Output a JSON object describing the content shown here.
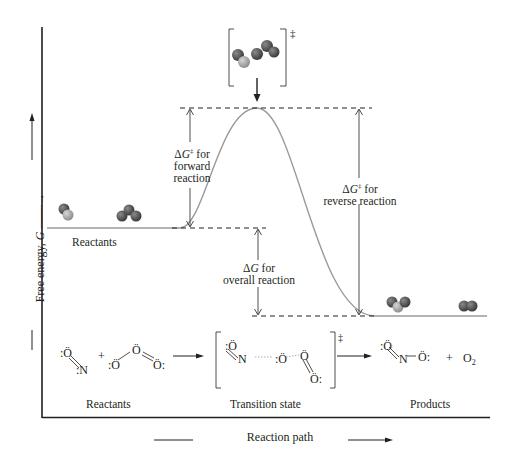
{
  "diagram": {
    "type": "reaction-energy-profile",
    "y_axis_label": "Free energy, G",
    "x_axis_label": "Reaction path",
    "double_dagger": "‡",
    "annotations": {
      "forward": {
        "line1_prefix": "ΔG",
        "line1_suffix": " for",
        "line2": "forward",
        "line3": "reaction"
      },
      "reverse": {
        "line1_prefix": "ΔG",
        "line1_suffix": " for",
        "line2": "reverse reaction"
      },
      "overall": {
        "line1_prefix": "ΔG",
        "line1_suffix": " for",
        "line2": "overall reaction"
      }
    },
    "curve_labels": {
      "reactants": "Reactants"
    },
    "bottom_row": {
      "reactants_label": "Reactants",
      "transition_label": "Transition state",
      "products_label": "Products",
      "reactants_formula": {
        "no": "NO",
        "plus": "+",
        "o3": "O3"
      },
      "products_formula": {
        "no2": "NO2",
        "plus": "+",
        "o2": "O2"
      }
    },
    "colors": {
      "curve": "#9a9a9a",
      "ink": "#231f20",
      "atom_dark": "#5a5a5a",
      "atom_light": "#a8a8a8"
    }
  },
  "chart_data": {
    "type": "line",
    "title": "",
    "xlabel": "Reaction path",
    "ylabel": "Free energy, G",
    "levels": {
      "reactants": "low-mid",
      "transition_state": "peak",
      "products": "lowest"
    },
    "relative_energy_px_from_axis": {
      "reactants": 189,
      "transition_state": 309,
      "products": 101
    },
    "annotations": [
      "ΔG‡ for forward reaction",
      "ΔG‡ for reverse reaction",
      "ΔG for overall reaction"
    ]
  }
}
